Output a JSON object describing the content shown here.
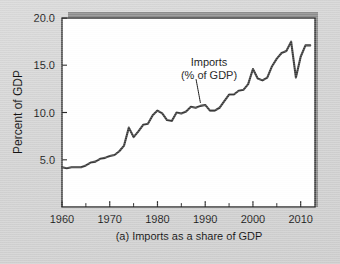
{
  "figure": {
    "caption": "(a) Imports as a share of GDP",
    "background_color": "#d4d4d4",
    "plot_background_color": "#ffffff",
    "frame_color": "#2b2b2b",
    "shadow_color": "#8d8d8d",
    "line_color": "#3a3a3a"
  },
  "annotation": {
    "line1": "Imports",
    "line2": "(% of GDP)",
    "target_year": 1989,
    "target_value": 10.7
  },
  "chart_data": {
    "type": "line",
    "title": "",
    "subtitle": "",
    "caption": "(a) Imports as a share of GDP",
    "xlabel": "",
    "ylabel": "Percent of GDP",
    "xlim": [
      1960,
      2013
    ],
    "ylim": [
      0,
      20
    ],
    "grid": false,
    "legend_position": "none",
    "x_ticks_major": [
      1960,
      1970,
      1980,
      1990,
      2000,
      2010
    ],
    "x_tick_labels": [
      "1960",
      "1970",
      "1980",
      "1990",
      "2000",
      "2010"
    ],
    "x_ticks_minor": [
      1965,
      1975,
      1985,
      1995,
      2005
    ],
    "y_ticks": [
      5.0,
      10.0,
      15.0,
      20.0
    ],
    "y_tick_labels": [
      "5.0",
      "10.0",
      "15.0",
      "20.0"
    ],
    "series": [
      {
        "name": "Imports (% of GDP)",
        "x": [
          1960,
          1961,
          1962,
          1963,
          1964,
          1965,
          1966,
          1967,
          1968,
          1969,
          1970,
          1971,
          1972,
          1973,
          1974,
          1975,
          1976,
          1977,
          1978,
          1979,
          1980,
          1981,
          1982,
          1983,
          1984,
          1985,
          1986,
          1987,
          1988,
          1989,
          1990,
          1991,
          1992,
          1993,
          1994,
          1995,
          1996,
          1997,
          1998,
          1999,
          2000,
          2001,
          2002,
          2003,
          2004,
          2005,
          2006,
          2007,
          2008,
          2009,
          2010,
          2011,
          2012
        ],
        "values": [
          4.2,
          4.1,
          4.2,
          4.2,
          4.2,
          4.4,
          4.7,
          4.8,
          5.1,
          5.2,
          5.4,
          5.5,
          5.9,
          6.5,
          8.4,
          7.4,
          8.0,
          8.7,
          8.8,
          9.7,
          10.2,
          9.9,
          9.2,
          9.1,
          10.0,
          9.9,
          10.1,
          10.6,
          10.5,
          10.7,
          10.8,
          10.2,
          10.2,
          10.5,
          11.2,
          11.9,
          11.9,
          12.3,
          12.4,
          13.0,
          14.6,
          13.6,
          13.4,
          13.7,
          14.9,
          15.7,
          16.3,
          16.5,
          17.5,
          13.7,
          15.9,
          17.1,
          17.1
        ]
      }
    ]
  }
}
